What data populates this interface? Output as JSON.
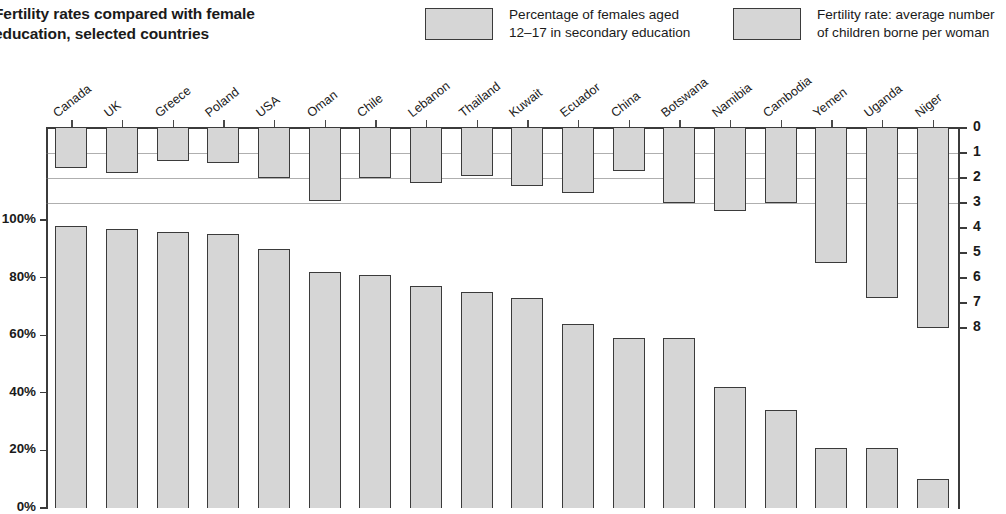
{
  "title": {
    "line1": "Fertility rates compared with female",
    "line2": "education, selected countries"
  },
  "legend": {
    "education": {
      "line1": "Percentage of females aged",
      "line2": "12–17 in secondary education"
    },
    "fertility": {
      "line1": "Fertility rate: average number",
      "line2": "of children borne per woman"
    }
  },
  "axes": {
    "left_ticks": [
      "100%",
      "80%",
      "60%",
      "40%",
      "20%",
      "0%"
    ],
    "right_ticks": [
      "0",
      "1",
      "2",
      "3",
      "4",
      "5",
      "6",
      "7",
      "8"
    ],
    "left_label": "Percentage of females aged 12–17 in secondary education",
    "right_label": "Fertility rate: average number of children borne per woman"
  },
  "chart_data": {
    "type": "bar",
    "title": "Fertility rates compared with female education, selected countries",
    "xlabel": "",
    "ylabel": "Percentage of females aged 12–17 in secondary education",
    "y2label": "Fertility rate: average number of children borne per woman",
    "ylim": [
      0,
      100
    ],
    "y2lim": [
      0,
      8
    ],
    "grid": true,
    "legend_position": "top",
    "categories": [
      "Canada",
      "UK",
      "Greece",
      "Poland",
      "USA",
      "Oman",
      "Chile",
      "Lebanon",
      "Thailand",
      "Kuwait",
      "Ecuador",
      "China",
      "Botswana",
      "Namibia",
      "Cambodia",
      "Yemen",
      "Uganda",
      "Niger"
    ],
    "series": [
      {
        "name": "Percentage of females aged 12–17 in secondary education",
        "axis": "left",
        "unit": "%",
        "values": [
          98,
          97,
          96,
          95,
          90,
          82,
          81,
          77,
          75,
          73,
          64,
          59,
          59,
          42,
          34,
          21,
          21,
          10
        ]
      },
      {
        "name": "Fertility rate: average number of children borne per woman",
        "axis": "right",
        "unit": "children",
        "values": [
          1.6,
          1.8,
          1.3,
          1.4,
          2.0,
          2.9,
          2.0,
          2.2,
          1.9,
          2.3,
          2.6,
          1.7,
          3.0,
          3.3,
          3.0,
          5.4,
          6.8,
          8.0
        ]
      }
    ]
  }
}
